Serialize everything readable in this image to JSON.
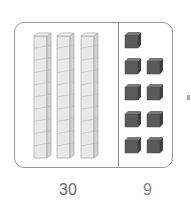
{
  "diagram": {
    "tens": {
      "count": 3,
      "units_per_rod": 10,
      "label": "30",
      "color": "#e6e6e6"
    },
    "ones": {
      "count": 9,
      "label": "9",
      "color": "#555555"
    },
    "labels": {
      "tens": "30",
      "ones": "9"
    }
  }
}
